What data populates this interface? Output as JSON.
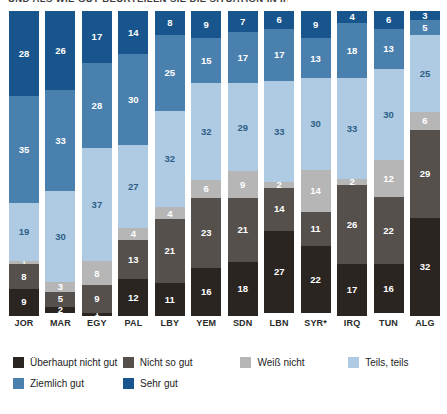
{
  "title": "UND ALS WIE GUT BEURTEILEN SIE DIE SITUATION IN IHREM LAND?",
  "chart_data": {
    "type": "bar",
    "subtype": "stacked-100-percent",
    "title": "UND ALS WIE GUT BEURTEILEN SIE DIE SITUATION IN IHREM LAND?",
    "xlabel": "",
    "ylabel": "",
    "ylim": [
      0,
      100
    ],
    "grid": false,
    "legend_position": "bottom",
    "orientation": "vertical",
    "categories": [
      "JOR",
      "MAR",
      "EGY",
      "PAL",
      "LBY",
      "YEM",
      "SDN",
      "LBN",
      "SYR*",
      "IRQ",
      "TUN",
      "ALG"
    ],
    "stack_order_bottom_to_top": [
      "Überhaupt nicht gut",
      "Nicht so gut",
      "Weiß nicht",
      "Teils, teils",
      "Ziemlich gut",
      "Sehr gut"
    ],
    "series": [
      {
        "name": "Überhaupt nicht gut",
        "color": "#2b2522",
        "label_color": "#ffffff",
        "values": [
          9,
          2,
          1,
          12,
          11,
          16,
          18,
          27,
          22,
          17,
          16,
          32
        ]
      },
      {
        "name": "Nicht so gut",
        "color": "#55504c",
        "label_color": "#ffffff",
        "values": [
          8,
          5,
          9,
          13,
          21,
          23,
          21,
          14,
          11,
          26,
          22,
          29
        ]
      },
      {
        "name": "Weiß nicht",
        "color": "#b6b6b6",
        "label_color": "#ffffff",
        "values": [
          1,
          3,
          8,
          4,
          4,
          6,
          9,
          2,
          14,
          2,
          12,
          6
        ]
      },
      {
        "name": "Teils, teils",
        "color": "#aecbe3",
        "label_color": "#2d5f86",
        "values": [
          19,
          30,
          37,
          27,
          32,
          32,
          29,
          33,
          30,
          33,
          30,
          25
        ]
      },
      {
        "name": "Ziemlich gut",
        "color": "#4a80ae",
        "label_color": "#ffffff",
        "values": [
          35,
          33,
          28,
          30,
          25,
          15,
          17,
          17,
          13,
          18,
          13,
          5
        ]
      },
      {
        "name": "Sehr gut",
        "color": "#17558c",
        "label_color": "#ffffff",
        "values": [
          28,
          26,
          17,
          14,
          8,
          9,
          7,
          6,
          9,
          4,
          6,
          3
        ]
      }
    ]
  },
  "legend": {
    "items": [
      {
        "label": "Überhaupt nicht gut",
        "color": "#2b2522"
      },
      {
        "label": "Nicht so gut",
        "color": "#55504c"
      },
      {
        "label": "Weiß nicht",
        "color": "#b6b6b6"
      },
      {
        "label": "Teils, teils",
        "color": "#aecbe3"
      },
      {
        "label": "Ziemlich gut",
        "color": "#4a80ae"
      },
      {
        "label": "Sehr gut",
        "color": "#17558c"
      }
    ]
  }
}
